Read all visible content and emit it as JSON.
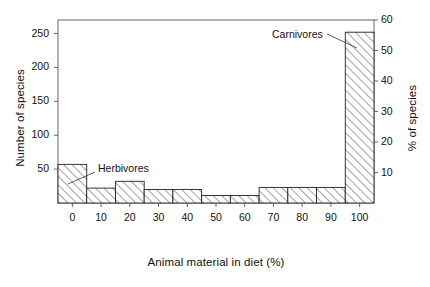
{
  "chart_data": {
    "type": "bar",
    "title": "",
    "subtitle": "",
    "xlabel": "Animal material in diet (%)",
    "ylabel": "Number of species",
    "ylabel_right": "% of species",
    "grid": false,
    "legend_position": "none",
    "xlim": [
      -5,
      105
    ],
    "ylim": [
      0,
      270
    ],
    "ylim_right": [
      0,
      60
    ],
    "xticks": [
      0,
      10,
      20,
      30,
      40,
      50,
      60,
      70,
      80,
      90,
      100
    ],
    "xticklabels": [
      "0",
      "10",
      "20",
      "30",
      "40",
      "50",
      "60",
      "70",
      "80",
      "90",
      "100"
    ],
    "yticks": [
      50,
      100,
      150,
      200,
      250
    ],
    "yticklabels": [
      "50",
      "100",
      "150",
      "200",
      "250"
    ],
    "yticks_right": [
      10,
      20,
      30,
      40,
      50,
      60
    ],
    "yticklabels_right": [
      "10",
      "20",
      "30",
      "40",
      "50",
      "60"
    ],
    "bin_edges": [
      -5,
      5,
      15,
      25,
      35,
      45,
      55,
      65,
      75,
      85,
      95,
      105
    ],
    "categories": [
      "0",
      "10",
      "20",
      "30",
      "40",
      "50",
      "60",
      "70",
      "80",
      "90",
      "100"
    ],
    "values": [
      57,
      22,
      32,
      20,
      20,
      11,
      11,
      23,
      23,
      23,
      252
    ],
    "values_percent": [
      12.7,
      4.9,
      7.1,
      4.4,
      4.4,
      2.4,
      2.4,
      5.1,
      5.1,
      5.1,
      56.0
    ],
    "bar_fill": "hatch-diagonal",
    "bar_edge_color": "#222222",
    "annotations": [
      {
        "text": "Herbivores",
        "target_category": "0",
        "text_x": 98,
        "text_y": 162,
        "leader_from_x": 95,
        "leader_from_y": 172,
        "leader_to_x": 68,
        "leader_to_y": 184
      },
      {
        "text": "Carnivores",
        "target_category": "100",
        "text_x": 272,
        "text_y": 28,
        "leader_from_x": 327,
        "leader_from_y": 34,
        "leader_to_x": 357,
        "leader_to_y": 48
      }
    ]
  },
  "axes": {
    "frame_color": "#555555",
    "background": "#ffffff"
  }
}
